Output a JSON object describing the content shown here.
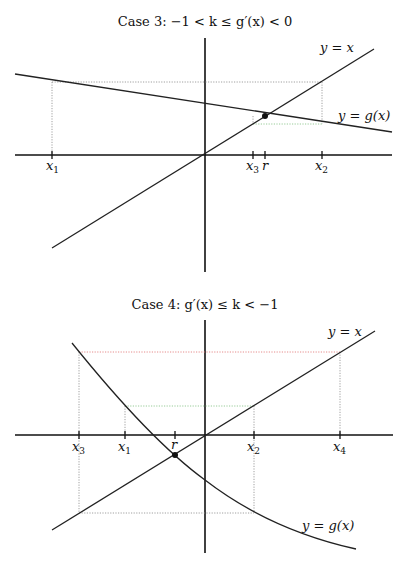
{
  "diagrams": [
    {
      "title": "Case 3:  −1 < k ≤ g′(x) < 0",
      "line_label": "y = x",
      "curve_label": "y = g(x)",
      "ticks": [
        {
          "name": "x",
          "sub": "1",
          "x": 52
        },
        {
          "name": "x",
          "sub": "3",
          "x": 253
        },
        {
          "name": "r",
          "sub": "",
          "x": 265
        },
        {
          "name": "x",
          "sub": "2",
          "x": 322
        }
      ],
      "fixed_point": "r",
      "guide_colors": {
        "default": "#888888",
        "highlight": "#7fbf7f"
      }
    },
    {
      "title": "Case 4:  g′(x) ≤ k < −1",
      "line_label": "y = x",
      "curve_label": "y = g(x)",
      "ticks": [
        {
          "name": "x",
          "sub": "3",
          "x": 79
        },
        {
          "name": "x",
          "sub": "1",
          "x": 125
        },
        {
          "name": "r",
          "sub": "",
          "x": 175
        },
        {
          "name": "x",
          "sub": "2",
          "x": 254
        },
        {
          "name": "x",
          "sub": "4",
          "x": 340
        }
      ],
      "fixed_point": "r",
      "guide_colors": {
        "default": "#888888",
        "red": "#e07070",
        "green": "#7fbf7f"
      }
    }
  ]
}
